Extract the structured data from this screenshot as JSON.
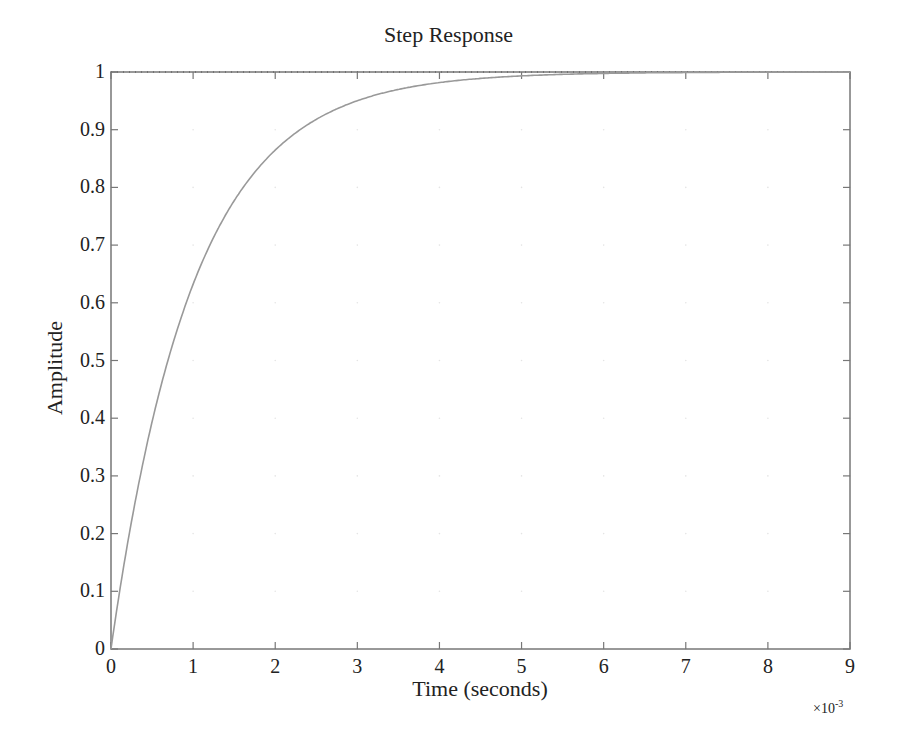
{
  "chart_data": {
    "type": "line",
    "title": "Step Response",
    "xlabel": "Time (seconds)",
    "ylabel": "Amplitude",
    "x_multiplier": "×10",
    "x_multiplier_exp": "-3",
    "xlim": [
      0,
      9
    ],
    "ylim": [
      0,
      1
    ],
    "xticks": [
      "0",
      "1",
      "2",
      "3",
      "4",
      "5",
      "6",
      "7",
      "8",
      "9"
    ],
    "yticks": [
      "0",
      "0.1",
      "0.2",
      "0.3",
      "0.4",
      "0.5",
      "0.6",
      "0.7",
      "0.8",
      "0.9",
      "1"
    ],
    "grid": "faint dotted",
    "legend": "none",
    "reference_line": {
      "y": 1,
      "style": "dotted"
    },
    "series": [
      {
        "name": "Step Response",
        "color": "#999999",
        "x": [
          0,
          0.25,
          0.5,
          0.75,
          1,
          1.25,
          1.5,
          1.75,
          2,
          2.5,
          3,
          3.5,
          4,
          4.5,
          5,
          5.5,
          6,
          7,
          8,
          9
        ],
        "values": [
          0,
          0.221,
          0.393,
          0.528,
          0.632,
          0.713,
          0.777,
          0.826,
          0.865,
          0.918,
          0.95,
          0.97,
          0.982,
          0.989,
          0.993,
          0.996,
          0.998,
          0.999,
          1.0,
          1.0
        ]
      }
    ]
  },
  "colors": {
    "axis": "#777777",
    "curve": "#999999",
    "text": "#222222"
  }
}
